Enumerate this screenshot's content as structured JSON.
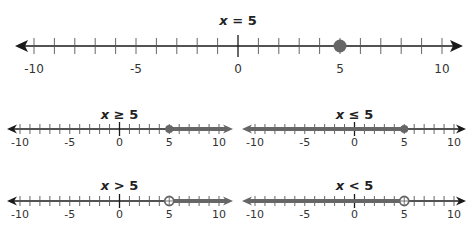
{
  "colors": {
    "axis": "#1a1a1a",
    "tick": "#555555",
    "highlight": "#666666",
    "text": "#222222"
  },
  "chart_data": [
    {
      "type": "number-line",
      "title": "x = 5",
      "title_var": "x",
      "title_rest": " = 5",
      "range": [
        -10,
        10
      ],
      "tick_step": 1,
      "labels": [
        "-10",
        "-5",
        "0",
        "5",
        "10"
      ],
      "point": {
        "value": 5,
        "style": "closed"
      },
      "shade": null
    },
    {
      "type": "number-line",
      "title": "x ≥ 5",
      "title_var": "x",
      "title_rest": " ≥ 5",
      "range": [
        -10,
        10
      ],
      "tick_step": 1,
      "labels": [
        "-10",
        "-5",
        "0",
        "5",
        "10"
      ],
      "point": {
        "value": 5,
        "style": "closed"
      },
      "shade": "right"
    },
    {
      "type": "number-line",
      "title": "x ≤ 5",
      "title_var": "x",
      "title_rest": " ≤ 5",
      "range": [
        -10,
        10
      ],
      "tick_step": 1,
      "labels": [
        "-10",
        "-5",
        "0",
        "5",
        "10"
      ],
      "point": {
        "value": 5,
        "style": "closed"
      },
      "shade": "left"
    },
    {
      "type": "number-line",
      "title": "x > 5",
      "title_var": "x",
      "title_rest": " > 5",
      "range": [
        -10,
        10
      ],
      "tick_step": 1,
      "labels": [
        "-10",
        "-5",
        "0",
        "5",
        "10"
      ],
      "point": {
        "value": 5,
        "style": "open"
      },
      "shade": "right"
    },
    {
      "type": "number-line",
      "title": "x < 5",
      "title_var": "x",
      "title_rest": " < 5",
      "range": [
        -10,
        10
      ],
      "tick_step": 1,
      "labels": [
        "-10",
        "-5",
        "0",
        "5",
        "10"
      ],
      "point": {
        "value": 5,
        "style": "open"
      },
      "shade": "left"
    }
  ],
  "layout": [
    {
      "x0": 34,
      "x1": 442,
      "y": 46,
      "arrowL": 15,
      "arrowR": 463,
      "titleY": 25,
      "labelY": 73,
      "fontSize": 12,
      "titleSize": 14,
      "tickH": 8,
      "zeroH": 11,
      "dot": 6.5
    },
    {
      "x0": 20,
      "x1": 219,
      "y": 129,
      "arrowL": 7,
      "arrowR": 233,
      "titleY": 119,
      "labelY": 146,
      "fontSize": 11,
      "titleSize": 13,
      "tickH": 5,
      "zeroH": 7,
      "dot": 4
    },
    {
      "x0": 255,
      "x1": 454,
      "y": 129,
      "arrowL": 242,
      "arrowR": 466,
      "titleY": 119,
      "labelY": 146,
      "fontSize": 11,
      "titleSize": 13,
      "tickH": 5,
      "zeroH": 7,
      "dot": 4
    },
    {
      "x0": 20,
      "x1": 219,
      "y": 201,
      "arrowL": 7,
      "arrowR": 233,
      "titleY": 190,
      "labelY": 218,
      "fontSize": 11,
      "titleSize": 13,
      "tickH": 5,
      "zeroH": 7,
      "dot": 4.5
    },
    {
      "x0": 255,
      "x1": 454,
      "y": 201,
      "arrowL": 242,
      "arrowR": 466,
      "titleY": 190,
      "labelY": 218,
      "fontSize": 11,
      "titleSize": 13,
      "tickH": 5,
      "zeroH": 7,
      "dot": 4.5
    }
  ]
}
